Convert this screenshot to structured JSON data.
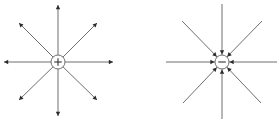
{
  "diagram": {
    "title": "",
    "colors": {
      "line": "#6e6e6e",
      "arrowhead": "#2b2b2b",
      "circle_stroke": "#6e6e6e",
      "background": "#ffffff"
    },
    "charges": [
      {
        "id": "positive",
        "sign": "+",
        "label": "+",
        "center": [
          58,
          62
        ],
        "radius": 7,
        "field_direction": "outward",
        "field_lines": [
          {
            "direction": "up",
            "end": [
              58,
              5
            ]
          },
          {
            "direction": "down",
            "end": [
              58,
              116
            ]
          },
          {
            "direction": "left",
            "end": [
              4,
              62
            ]
          },
          {
            "direction": "right",
            "end": [
              113,
              62
            ]
          },
          {
            "direction": "up-left",
            "end": [
              19,
              23
            ]
          },
          {
            "direction": "up-right",
            "end": [
              97,
              23
            ]
          },
          {
            "direction": "down-left",
            "end": [
              19,
              100
            ]
          },
          {
            "direction": "down-right",
            "end": [
              97,
              100
            ]
          }
        ]
      },
      {
        "id": "negative",
        "sign": "-",
        "label": "−",
        "center": [
          222,
          62
        ],
        "radius": 7,
        "field_direction": "inward",
        "field_lines": [
          {
            "direction": "up",
            "start": [
              222,
              4
            ]
          },
          {
            "direction": "down",
            "start": [
              222,
              119
            ]
          },
          {
            "direction": "left",
            "start": [
              166,
              62
            ]
          },
          {
            "direction": "right",
            "start": [
              277,
              62
            ]
          },
          {
            "direction": "up-left",
            "start": [
              182,
              21
            ]
          },
          {
            "direction": "up-right",
            "start": [
              262,
              21
            ]
          },
          {
            "direction": "down-left",
            "start": [
              183,
              103
            ]
          },
          {
            "direction": "down-right",
            "start": [
              261,
              103
            ]
          }
        ]
      }
    ]
  }
}
